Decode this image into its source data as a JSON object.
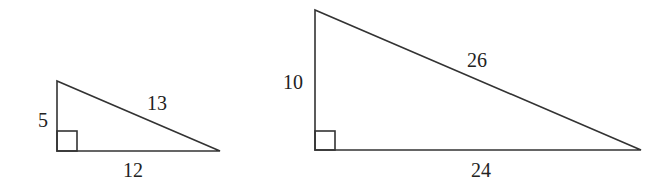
{
  "diagram": {
    "type": "similar-right-triangles",
    "triangles": [
      {
        "name": "small-triangle",
        "legs": {
          "vertical": "5",
          "horizontal": "12"
        },
        "hypotenuse": "13",
        "right_angle_marker": true
      },
      {
        "name": "large-triangle",
        "legs": {
          "vertical": "10",
          "horizontal": "24"
        },
        "hypotenuse": "26",
        "right_angle_marker": true
      }
    ]
  }
}
